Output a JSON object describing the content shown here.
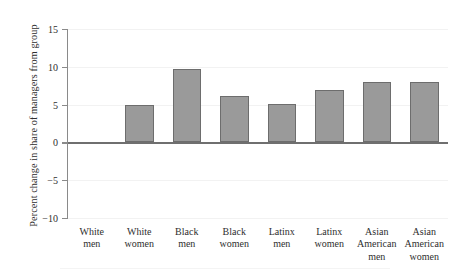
{
  "chart_data": {
    "type": "bar",
    "title": "",
    "xlabel": "",
    "ylabel": "Percent change in share of managers from group",
    "categories": [
      "White men",
      "White women",
      "Black men",
      "Black women",
      "Latinx men",
      "Latinx women",
      "Asian American men",
      "Asian American women"
    ],
    "category_lines": [
      [
        "White",
        "men"
      ],
      [
        "White",
        "women"
      ],
      [
        "Black",
        "men"
      ],
      [
        "Black",
        "women"
      ],
      [
        "Latinx",
        "men"
      ],
      [
        "Latinx",
        "women"
      ],
      [
        "Asian",
        "American",
        "men"
      ],
      [
        "Asian",
        "American",
        "women"
      ]
    ],
    "values": [
      0,
      4.9,
      9.7,
      6.2,
      5.1,
      6.9,
      8.0,
      8.0
    ],
    "ylim": [
      -10,
      15
    ],
    "yticks": [
      15,
      10,
      5,
      0,
      -5,
      -10
    ],
    "ytick_labels": [
      "15",
      "10",
      "5",
      "0",
      "−5",
      "−10"
    ],
    "grid": true,
    "grid_axis": "y",
    "legend": "none",
    "bar_color": "#9a9a9a",
    "bar_edge_color": "#6d6d6d",
    "gridline_color": "#f2f2f2",
    "zero_line_color": "#6f6f6f",
    "axis_color": "#8a8a8a",
    "background": "#ffffff"
  }
}
